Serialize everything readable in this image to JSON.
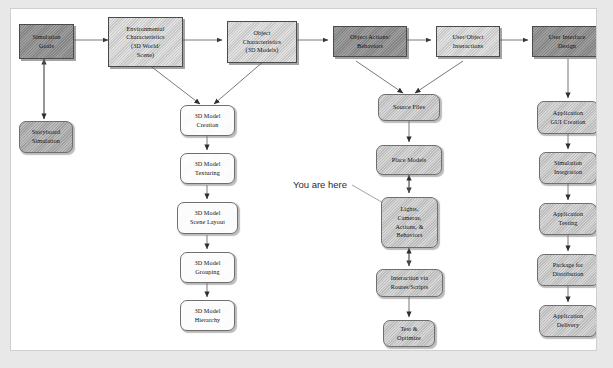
{
  "diagram": {
    "annotation": "You are here",
    "colors": {
      "panel_background": "#ffffff",
      "outer_background": "#e8e8e8",
      "header_dark": "#8c8c8c",
      "header_light": "#d2d2d2",
      "node_white": "#fdfdfd",
      "node_gray": "#c6c6c6",
      "node_midgray": "#a9a9a9",
      "arrow": "#555555",
      "text": "#111111"
    },
    "nodes": {
      "simulation_goals": "Simulation\nGoals",
      "storyboard_simulation": "Storyboard\nSimulation",
      "environmental_characteristics": "Environmental\nCharacteristics\n(3D World/\nScene)",
      "object_characteristics": "Object\nCharacteristics\n(3D Models)",
      "object_actions_behaviors": "Object Actions/\nBehaviors",
      "user_object_interactions": "User/Object\nInteractions",
      "user_interface_design": "User Interface\nDesign",
      "model_creation": "3D Model\nCreation",
      "model_texturing": "3D Model\nTexturing",
      "model_scene_layout": "3D Model\nScene Layout",
      "model_grouping": "3D Model\nGrouping",
      "model_hierarchy": "3D Model\nHierarchy",
      "source_files": "Source Files",
      "place_models": "Place Models",
      "lights_cameras": "Lights,\nCameras,\nActions, &\nBehaviors",
      "interaction_routes": "Interaction via\nRoutes/Scripts",
      "test_optimize": "Test &\nOptimize",
      "application_gui_creation": "Application\nGUI Creation",
      "simulation_integration": "Simulation\nIntegration",
      "application_testing": "Application\nTesting",
      "package_for_distribution": "Package for\nDistribution",
      "application_delivery": "Application\nDelivery"
    }
  }
}
